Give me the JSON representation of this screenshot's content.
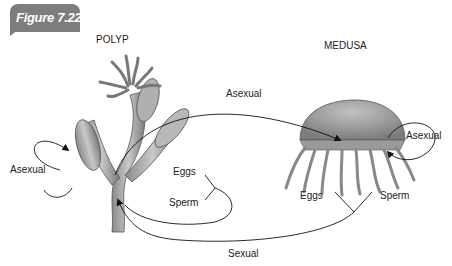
{
  "figure": {
    "badge_label": "Figure 7.22",
    "badge_color": "#7d7d7d"
  },
  "labels": {
    "polyp": "POLYP",
    "medusa": "MEDUSA",
    "asexual_left": "Asexual",
    "asexual_top": "Asexual",
    "asexual_right": "Asexual",
    "eggs_polyp": "Eggs",
    "sperm_polyp": "Sperm",
    "eggs_medusa": "Eggs",
    "sperm_medusa": "Sperm",
    "sexual": "Sexual"
  },
  "icons": {
    "polyp": "polyp-illustration-icon",
    "medusa": "medusa-illustration-icon"
  }
}
